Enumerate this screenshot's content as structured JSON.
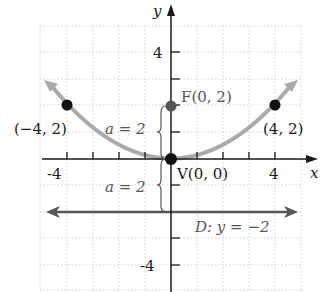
{
  "diagram": {
    "type": "parabola-graph",
    "axes": {
      "x_label": "x",
      "y_label": "y",
      "x_ticks": [
        "-4",
        "4"
      ],
      "y_ticks": [
        "4",
        "-4"
      ],
      "x_range": [
        -5,
        5
      ],
      "y_range": [
        -5,
        5
      ]
    },
    "curve": {
      "equation": "x^2 = 8y",
      "color": "#aaaaaa"
    },
    "points": [
      {
        "name": "left-point",
        "label": "(−4, 2)",
        "x": -4,
        "y": 2
      },
      {
        "name": "right-point",
        "label": "(4, 2)",
        "x": 4,
        "y": 2
      },
      {
        "name": "focus",
        "label": "F(0, 2)",
        "x": 0,
        "y": 2
      },
      {
        "name": "vertex",
        "label": "V(0, 0)",
        "x": 0,
        "y": 0
      }
    ],
    "directrix": {
      "label": "D: y = −2",
      "y": -2,
      "color": "#555555"
    },
    "distance_labels": {
      "upper": "a = 2",
      "lower": "a = 2"
    }
  }
}
